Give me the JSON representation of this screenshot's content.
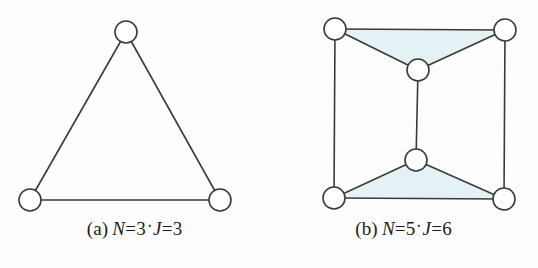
{
  "page": {
    "background_color": "#fdfdfd",
    "width": 538,
    "height": 268
  },
  "style": {
    "stroke_color": "#3a3a3a",
    "node_fill": "#ffffff",
    "shade_fill": "#e4f2f5",
    "text_color": "#1b1b1b",
    "stroke_width": 1.6,
    "node_radius": 11
  },
  "figures": [
    {
      "id": "figure-a",
      "caption": {
        "label": "(a)",
        "var1": "N",
        "eq1": "=",
        "val1": "3",
        "separator": "‧",
        "var2": "J",
        "eq2": "=",
        "val2": "6_unused",
        "val2_text": "3"
      },
      "graph": {
        "type": "undirected-graph",
        "node_count": 3,
        "edge_count": 3,
        "shaded_faces": 0,
        "nodes": [
          {
            "id": "a-top",
            "name": "node-top",
            "cx": 126,
            "cy": 32
          },
          {
            "id": "a-bottom-left",
            "name": "node-bottom-left",
            "cx": 30,
            "cy": 200
          },
          {
            "id": "a-bottom-right",
            "name": "node-bottom-right",
            "cx": 220,
            "cy": 200
          }
        ],
        "edges": [
          {
            "from": "a-top",
            "to": "a-bottom-left"
          },
          {
            "from": "a-top",
            "to": "a-bottom-right"
          },
          {
            "from": "a-bottom-left",
            "to": "a-bottom-right"
          }
        ],
        "faces": []
      }
    },
    {
      "id": "figure-b",
      "caption": {
        "label": "(b)",
        "var1": "N",
        "eq1": "=",
        "val1": "5",
        "separator": "‧",
        "var2": "J",
        "eq2": "=",
        "val2_text": "6"
      },
      "graph": {
        "type": "undirected-graph",
        "node_count": 5,
        "edge_count": 6,
        "shaded_faces": 2,
        "nodes": [
          {
            "id": "b-top-left",
            "name": "node-top-left",
            "cx": 66,
            "cy": 29
          },
          {
            "id": "b-top-right",
            "name": "node-top-right",
            "cx": 236,
            "cy": 30
          },
          {
            "id": "b-center-upper",
            "name": "node-center-upper",
            "cx": 149,
            "cy": 70
          },
          {
            "id": "b-center-lower",
            "name": "node-center-lower",
            "cx": 147,
            "cy": 160
          },
          {
            "id": "b-bottom-left",
            "name": "node-bottom-left",
            "cx": 65,
            "cy": 198
          },
          {
            "id": "b-bottom-right",
            "name": "node-bottom-right",
            "cx": 235,
            "cy": 199
          }
        ],
        "edges": [
          {
            "from": "b-top-left",
            "to": "b-top-right"
          },
          {
            "from": "b-top-left",
            "to": "b-center-upper"
          },
          {
            "from": "b-top-right",
            "to": "b-center-upper"
          },
          {
            "from": "b-center-upper",
            "to": "b-center-lower"
          },
          {
            "from": "b-top-left",
            "to": "b-bottom-left"
          },
          {
            "from": "b-top-right",
            "to": "b-bottom-right"
          },
          {
            "from": "b-bottom-left",
            "to": "b-center-lower"
          },
          {
            "from": "b-bottom-right",
            "to": "b-center-lower"
          },
          {
            "from": "b-bottom-left",
            "to": "b-bottom-right"
          }
        ],
        "faces": [
          {
            "name": "shaded-triangle-top",
            "points": "66,29 236,30 149,70"
          },
          {
            "name": "shaded-triangle-bottom",
            "points": "65,198 235,199 147,160"
          }
        ]
      }
    }
  ]
}
